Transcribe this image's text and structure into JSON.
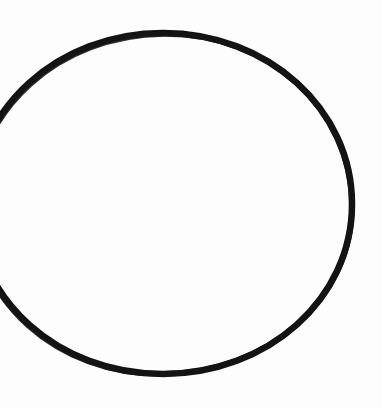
{
  "image": {
    "kind": "scanned-hand-drawing",
    "width": 382,
    "height": 408,
    "background_color": "#fdfdfd",
    "paper_tone": "#fdfdfd",
    "caption": "",
    "alt_text": "Hand-drawn black circle outline on white paper, cropped at the left edge"
  },
  "shape": {
    "name": "circle-outline",
    "type": "ellipse",
    "stroke_color": "#121212",
    "stroke_width": 6.5,
    "fill": "none",
    "center_x": 163,
    "center_y": 204,
    "radius_x": 189,
    "radius_y": 171,
    "top_y": 33,
    "bottom_y": 374,
    "right_x": 352,
    "clipped_edge": "left",
    "left_entry_y": 122,
    "left_exit_y": 278,
    "path": "M -26 204 C -26 109, 58 33, 163 33 C 268 33, 352 109, 352 204 C 352 299, 268 374, 163 374 C 58 374, -26 299, -26 204 Z"
  },
  "labels": {
    "none": ""
  }
}
